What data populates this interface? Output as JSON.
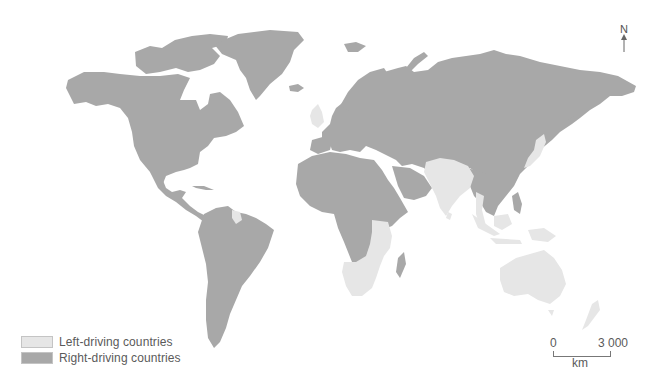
{
  "map": {
    "title": "",
    "type": "choropleth-world",
    "colors": {
      "background": "#ffffff",
      "left_driving": "#e6e6e6",
      "right_driving": "#a8a8a8",
      "legend_border": "#c4c4c4"
    }
  },
  "legend": {
    "items": [
      {
        "label": "Left-driving countries",
        "color": "#e6e6e6"
      },
      {
        "label": "Right-driving countries",
        "color": "#a8a8a8"
      }
    ]
  },
  "scale_bar": {
    "start": "0",
    "end": "3 000",
    "unit": "km"
  },
  "north_arrow": {
    "label": "N"
  },
  "regions": {
    "left_driving": [
      "United Kingdom",
      "Ireland",
      "India",
      "Pakistan",
      "Bangladesh",
      "Sri Lanka",
      "Thailand",
      "Malaysia",
      "Indonesia",
      "Japan",
      "Australia",
      "New Zealand",
      "Papua New Guinea",
      "South Africa",
      "Namibia",
      "Botswana",
      "Zimbabwe",
      "Mozambique",
      "Zambia",
      "Tanzania",
      "Kenya",
      "Uganda",
      "Malawi",
      "Guyana",
      "Suriname"
    ],
    "right_driving": [
      "North America",
      "Greenland",
      "Central America",
      "South America (most)",
      "Continental Europe",
      "Russia",
      "China",
      "Middle East",
      "North & Central Africa",
      "Madagascar",
      "Philippines",
      "Mainland Southeast Asia (most)"
    ]
  }
}
